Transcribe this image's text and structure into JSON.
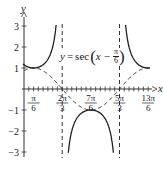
{
  "chart_data": {
    "type": "line",
    "title": "",
    "equation_label": "y = sec(x − π/6)",
    "xlabel": "x",
    "ylabel": "y",
    "xlim": [
      0,
      2.4
    ],
    "ylim": [
      -3,
      3
    ],
    "x_ticks": [
      {
        "num": "π",
        "den": "6",
        "value": 0.5236
      },
      {
        "num": "2π",
        "den": "3",
        "value": 2.0944
      },
      {
        "num": "7π",
        "den": "6",
        "value": 3.6652
      },
      {
        "num": "5π",
        "den": "3",
        "value": 5.236
      },
      {
        "num": "13π",
        "den": "6",
        "value": 6.8068
      }
    ],
    "y_ticks": [
      "3",
      "2",
      "1",
      "−1",
      "−2",
      "−3"
    ],
    "y_tick_values": [
      3,
      2,
      1,
      -1,
      -2,
      -3
    ],
    "asymptotes": [
      {
        "label": "x = 2π/3",
        "value": 2.0944
      },
      {
        "label": "x = 5π/3",
        "value": 5.236
      }
    ],
    "series": [
      {
        "name": "y = sec(x − π/6)",
        "style": "solid",
        "function": "sec(x - pi/6)"
      },
      {
        "name": "y = cos(x − π/6)",
        "style": "dashed",
        "function": "cos(x - pi/6)"
      }
    ],
    "key_points": [
      {
        "x": "π/6",
        "y": 1
      },
      {
        "x": "7π/6",
        "y": -1
      },
      {
        "x": "13π/6",
        "y": 1
      }
    ],
    "grid": false,
    "legend": "none"
  },
  "labels": {
    "x_axis": "x",
    "y_axis": "y",
    "eq_y": "y",
    "eq_eq": "=",
    "eq_sec": "sec",
    "eq_x": "x −",
    "eq_pi": "π",
    "eq_six": "6"
  }
}
